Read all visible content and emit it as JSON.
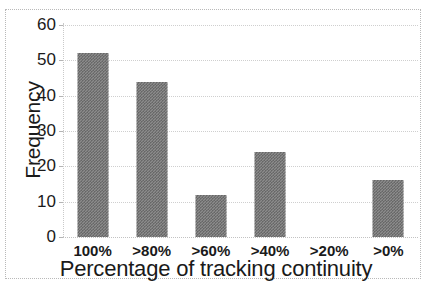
{
  "chart_data": {
    "type": "bar",
    "title": "",
    "xlabel": "Percentage of tracking continuity",
    "ylabel": "Frequency",
    "categories": [
      "100%",
      ">80%",
      ">60%",
      ">40%",
      ">20%",
      ">0%"
    ],
    "values": [
      52,
      44,
      12,
      24,
      0,
      16
    ],
    "ylim": [
      0,
      60
    ],
    "yticks": [
      0,
      10,
      20,
      30,
      40,
      50,
      60
    ],
    "ytick_labels": [
      "0",
      "10",
      "20",
      "30",
      "40",
      "50",
      "60"
    ],
    "grid": true,
    "grid_axis": "y",
    "legend": false,
    "bar_color": "#8c8c8c",
    "bar_pattern": "dither-checker",
    "text_color": "#1a1a1a",
    "gridline_color": "#cfcfcf",
    "background": "#ffffff"
  }
}
